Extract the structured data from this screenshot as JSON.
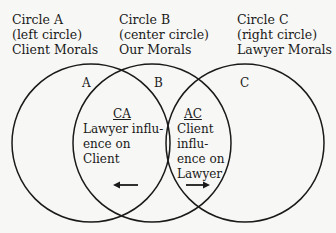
{
  "headers": [
    {
      "title": "Circle A",
      "position": "(left circle)",
      "meaning": "Client Morals"
    },
    {
      "title": "Circle B",
      "position": "(center circle)",
      "meaning": "Our Morals"
    },
    {
      "title": "Circle C",
      "position": "(right circle)",
      "meaning": "Lawyer Morals"
    }
  ],
  "circle_letters": [
    "A",
    "B",
    "C"
  ],
  "overlaps": {
    "ca": {
      "code": "CA",
      "lines": [
        "Lawyer influ-",
        "ence on",
        "Client"
      ],
      "arrow": "left"
    },
    "ac": {
      "code": "AC",
      "lines": [
        "Client",
        "influ-",
        "ence on",
        "Lawyer"
      ],
      "arrow": "right"
    }
  },
  "colors": {
    "stroke": "#1a1a1a",
    "background": "#f7f7f5"
  }
}
